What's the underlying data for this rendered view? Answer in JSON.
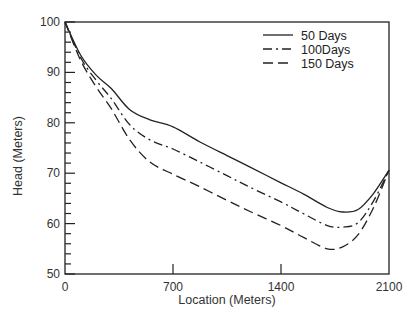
{
  "chart_data": {
    "type": "line",
    "title": "",
    "xlabel": "Location (Meters)",
    "ylabel": "Head (Meters)",
    "xlim": [
      0,
      2100
    ],
    "ylim": [
      50,
      100
    ],
    "xticks": [
      0,
      700,
      1400,
      2100
    ],
    "yticks": [
      50,
      60,
      70,
      80,
      90,
      100
    ],
    "grid": false,
    "legend_position": "upper right",
    "x": [
      0,
      100,
      200,
      300,
      420,
      550,
      700,
      875,
      1050,
      1200,
      1400,
      1550,
      1700,
      1800,
      1900,
      2000,
      2100
    ],
    "series": [
      {
        "name": "50 Days",
        "style": "solid",
        "values": [
          100,
          93.5,
          89.5,
          86.8,
          82.6,
          80.6,
          79.2,
          76.2,
          73.5,
          71.2,
          68.1,
          65.8,
          63.2,
          62.3,
          62.8,
          66.0,
          70.6
        ]
      },
      {
        "name": "100Days",
        "style": "dash-dot",
        "values": [
          100,
          93.0,
          88.5,
          84.8,
          79.6,
          76.6,
          74.8,
          72.2,
          69.5,
          67.2,
          64.3,
          61.9,
          59.6,
          59.3,
          60.2,
          64.5,
          70.6
        ]
      },
      {
        "name": "150 Days",
        "style": "dashed",
        "values": [
          100,
          92.5,
          87.2,
          82.8,
          76.6,
          72.2,
          69.8,
          67.3,
          64.6,
          62.4,
          59.6,
          57.2,
          55.0,
          55.4,
          57.8,
          63.2,
          70.6
        ]
      }
    ]
  },
  "axes": {
    "xlabel": "Location (Meters)",
    "ylabel": "Head (Meters)",
    "xtick_labels": [
      "0",
      "700",
      "1400",
      "2100"
    ],
    "ytick_labels": [
      "50",
      "60",
      "70",
      "80",
      "90",
      "100"
    ]
  },
  "legend": {
    "items": [
      {
        "label": "50 Days",
        "style": "solid"
      },
      {
        "label": "100Days",
        "style": "dash-dot"
      },
      {
        "label": "150 Days",
        "style": "dashed"
      }
    ]
  },
  "colors": {
    "ink": "#222222",
    "background": "#ffffff"
  }
}
